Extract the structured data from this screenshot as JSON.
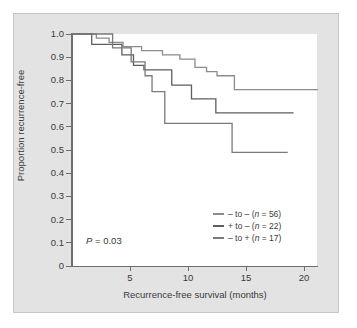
{
  "chart_data": {
    "type": "line",
    "subtype": "kaplan-meier-step",
    "title": "",
    "xlabel": "Recurrence-free survival (months)",
    "ylabel": "Proportion recurrence-free",
    "xlim": [
      0,
      21.5
    ],
    "ylim": [
      0,
      1.0
    ],
    "grid": false,
    "legend_position": "inside-bottom-right",
    "annotations": [
      {
        "name": "p-value",
        "text_prefix": "P",
        "text_body": " = 0.03",
        "x": 1.2,
        "y": 0.135
      }
    ],
    "xticks": [
      5,
      10,
      15,
      20
    ],
    "xtick_labels": [
      "5",
      "10",
      "15",
      "20"
    ],
    "yticks": [
      0,
      0.1,
      0.2,
      0.3,
      0.4,
      0.5,
      0.6,
      0.7,
      0.8,
      0.9,
      1.0
    ],
    "ytick_labels": [
      "0",
      "0.1",
      "0.2",
      "0.3",
      "0.4",
      "0.5",
      "0.6",
      "0.7",
      "0.8",
      "0.9",
      "1.0"
    ],
    "series": [
      {
        "name": "- to - (n = 56)",
        "legend_prefix": "– to – (",
        "legend_italic": "n",
        "legend_suffix": " = 56)",
        "n": 56,
        "color": "#8c8c8c",
        "final_value": 0.76,
        "points": [
          [
            0.0,
            1.0
          ],
          [
            2.1,
            1.0
          ],
          [
            2.1,
            0.982
          ],
          [
            3.2,
            0.982
          ],
          [
            3.2,
            0.964
          ],
          [
            4.4,
            0.964
          ],
          [
            4.4,
            0.946
          ],
          [
            6.0,
            0.946
          ],
          [
            6.0,
            0.928
          ],
          [
            7.8,
            0.928
          ],
          [
            7.8,
            0.91
          ],
          [
            9.3,
            0.91
          ],
          [
            9.3,
            0.892
          ],
          [
            10.6,
            0.892
          ],
          [
            10.6,
            0.856
          ],
          [
            11.6,
            0.856
          ],
          [
            11.6,
            0.838
          ],
          [
            12.5,
            0.838
          ],
          [
            12.5,
            0.82
          ],
          [
            14.0,
            0.82
          ],
          [
            14.0,
            0.76
          ],
          [
            21.2,
            0.76
          ]
        ]
      },
      {
        "name": "+ to - (n = 22)",
        "legend_prefix": "+ to – (",
        "legend_italic": "n",
        "legend_suffix": " = 22)",
        "n": 22,
        "color": "#5e5e5e",
        "final_value": 0.66,
        "points": [
          [
            0.0,
            1.0
          ],
          [
            1.7,
            1.0
          ],
          [
            1.7,
            0.955
          ],
          [
            4.3,
            0.955
          ],
          [
            4.3,
            0.91
          ],
          [
            5.3,
            0.91
          ],
          [
            5.3,
            0.865
          ],
          [
            6.2,
            0.865
          ],
          [
            6.2,
            0.845
          ],
          [
            8.6,
            0.845
          ],
          [
            8.6,
            0.78
          ],
          [
            10.3,
            0.78
          ],
          [
            10.3,
            0.72
          ],
          [
            12.4,
            0.72
          ],
          [
            12.4,
            0.66
          ],
          [
            19.1,
            0.66
          ]
        ]
      },
      {
        "name": "- to + (n = 17)",
        "legend_prefix": "– to + (",
        "legend_italic": "n",
        "legend_suffix": " = 17)",
        "n": 17,
        "color": "#7a7a7a",
        "final_value": 0.49,
        "points": [
          [
            0.0,
            1.0
          ],
          [
            3.5,
            1.0
          ],
          [
            3.5,
            0.94
          ],
          [
            5.1,
            0.94
          ],
          [
            5.1,
            0.88
          ],
          [
            6.3,
            0.88
          ],
          [
            6.3,
            0.82
          ],
          [
            6.9,
            0.82
          ],
          [
            6.9,
            0.752
          ],
          [
            8.0,
            0.752
          ],
          [
            8.0,
            0.615
          ],
          [
            13.8,
            0.615
          ],
          [
            13.8,
            0.49
          ],
          [
            18.6,
            0.49
          ]
        ]
      }
    ]
  },
  "axes_geometry": {
    "plot_left_px": 72,
    "plot_top_px": 34,
    "plot_right_px": 317,
    "plot_bottom_px": 266,
    "x_month_to_px": 11.6,
    "y_one_to_px": 232
  }
}
